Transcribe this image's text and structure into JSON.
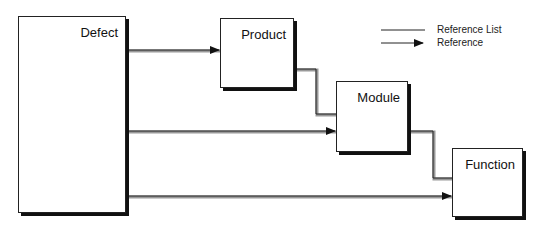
{
  "diagram": {
    "entities": [
      {
        "id": "defect",
        "label": "Defect"
      },
      {
        "id": "product",
        "label": "Product"
      },
      {
        "id": "module",
        "label": "Module"
      },
      {
        "id": "function",
        "label": "Function"
      }
    ],
    "relations": [
      {
        "from": "Defect",
        "to": "Product",
        "type": "Reference"
      },
      {
        "from": "Defect",
        "to": "Module",
        "type": "Reference"
      },
      {
        "from": "Defect",
        "to": "Function",
        "type": "Reference"
      },
      {
        "from": "Product",
        "to": "Module",
        "type": "Reference List"
      },
      {
        "from": "Module",
        "to": "Function",
        "type": "Reference List"
      }
    ],
    "legend": {
      "reference_list": "Reference List",
      "reference": "Reference"
    }
  }
}
